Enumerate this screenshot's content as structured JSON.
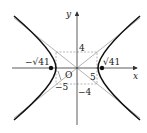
{
  "diagram": {
    "type": "hyperbola",
    "equation": "x^2/25 - y^2/16 = 1",
    "axes": {
      "x_label": "x",
      "y_label": "y",
      "origin_label": "O"
    },
    "labels": {
      "top": "4",
      "bottom": "−4",
      "right_a": "5",
      "left_a": "−5",
      "focus_right": "√41",
      "focus_left": "−√41"
    },
    "colors": {
      "curve": "#111111",
      "asymptote": "#aaaaaa",
      "dashed": "#999999",
      "axis": "#333333"
    }
  }
}
